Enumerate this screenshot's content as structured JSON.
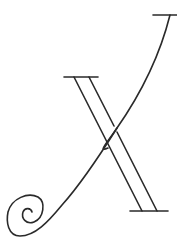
{
  "figure": {
    "letter": "X",
    "style": "decorative calligraphic line-art capital letter",
    "stroke_color": "#2a2a2a",
    "background": "#ffffff"
  }
}
